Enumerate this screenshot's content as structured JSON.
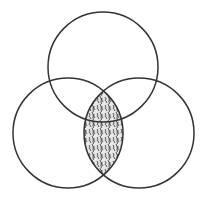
{
  "diagram": {
    "type": "venn",
    "sets": 3,
    "stroke_color": "#333333",
    "fill_pattern": "speckled-hatch",
    "circles": [
      {
        "name": "top",
        "cx": 103,
        "cy": 67,
        "r": 55
      },
      {
        "name": "bottom-left",
        "cx": 68,
        "cy": 133,
        "r": 55
      },
      {
        "name": "bottom-right",
        "cx": 139,
        "cy": 133,
        "r": 55
      }
    ],
    "shaded_region": "intersection of bottom-left and bottom-right circles"
  }
}
